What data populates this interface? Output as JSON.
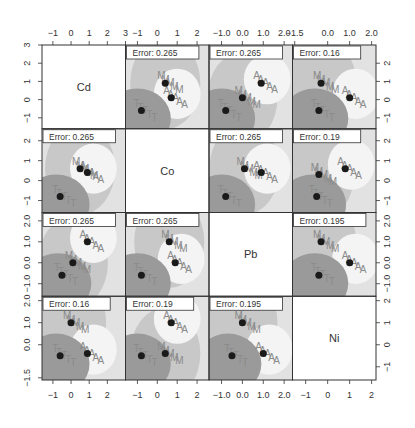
{
  "chart_data": {
    "type": "scatter",
    "subtype": "partition-plot-matrix",
    "variables": [
      "Cd",
      "Co",
      "Pb",
      "Ni"
    ],
    "classes": [
      "A",
      "M",
      "T"
    ],
    "grid": false,
    "legend": null,
    "axes": {
      "Cd": {
        "range": [
          -1.6,
          3.0
        ],
        "ticks": [
          "-1",
          "0",
          "1",
          "2",
          "3"
        ],
        "tick_values": [
          -1,
          0,
          1,
          2,
          3
        ]
      },
      "Co": {
        "range": [
          -1.6,
          2.6
        ],
        "ticks": [
          "-1",
          "0",
          "1",
          "2"
        ],
        "tick_values": [
          -1,
          0,
          1,
          2
        ]
      },
      "Pb": {
        "range": [
          -1.6,
          2.4
        ],
        "ticks": [
          "-1.0",
          "0.0",
          "1.0",
          "2.0"
        ],
        "tick_values": [
          -1,
          0,
          1,
          2
        ]
      },
      "Ni": {
        "range": [
          -1.6,
          2.2
        ],
        "ticks": [
          "-1.5",
          "0.0",
          "1.0",
          "2.0"
        ],
        "tick_values": [
          -1.5,
          0,
          1,
          2
        ]
      }
    },
    "top_axis_labels": [
      [
        "-1",
        "0",
        "1",
        "2",
        "3"
      ],
      [
        "-1",
        "0",
        "1",
        "2"
      ],
      [
        "-1.0",
        "0.0",
        "1.0",
        "2.0"
      ],
      [
        "-1.5",
        "0.0",
        "1.0",
        "2.0"
      ]
    ],
    "bottom_axis_labels": [
      [
        "-1",
        "0",
        "1",
        "2"
      ],
      [
        "-1",
        "0",
        "1",
        "2"
      ],
      [
        "-1.0",
        "0.0",
        "1.0",
        "2.0"
      ],
      [
        "-1",
        "0",
        "1",
        "2"
      ]
    ],
    "left_axis_labels": [
      [
        "-1",
        "0",
        "1",
        "2",
        "3"
      ],
      [
        "-1",
        "0",
        "1",
        "2"
      ],
      [
        "-1.0",
        "0.0",
        "1.0",
        "2.0"
      ],
      [
        "-1.5",
        "0.0",
        "1.0",
        "2.0"
      ]
    ],
    "right_axis_labels": [
      [
        "-1",
        "0",
        "1",
        "2"
      ],
      [
        "-1",
        "0",
        "1",
        "2"
      ],
      [
        "-1.0",
        "0.0",
        "1.0",
        "2.0"
      ],
      [
        "-1",
        "0",
        "1",
        "2"
      ]
    ],
    "panels": [
      {
        "row": 0,
        "col": 1,
        "x": "Co",
        "y": "Cd",
        "error": "Error: 0.265",
        "centroids": [
          [
            -0.8,
            -0.6
          ],
          [
            0.4,
            0.9
          ],
          [
            0.7,
            0.1
          ]
        ]
      },
      {
        "row": 0,
        "col": 2,
        "x": "Pb",
        "y": "Cd",
        "error": "Error: 0.265",
        "centroids": [
          [
            -0.8,
            -0.6
          ],
          [
            0.0,
            0.1
          ],
          [
            0.9,
            0.9
          ]
        ]
      },
      {
        "row": 0,
        "col": 3,
        "x": "Ni",
        "y": "Cd",
        "error": "Error: 0.16",
        "centroids": [
          [
            -0.4,
            -0.6
          ],
          [
            -0.3,
            0.9
          ],
          [
            1.0,
            0.1
          ]
        ]
      },
      {
        "row": 1,
        "col": 0,
        "x": "Cd",
        "y": "Co",
        "error": "Error: 0.265",
        "centroids": [
          [
            -0.6,
            -0.8
          ],
          [
            0.5,
            0.6
          ],
          [
            0.9,
            0.4
          ]
        ]
      },
      {
        "row": 1,
        "col": 2,
        "x": "Pb",
        "y": "Co",
        "error": "Error: 0.265",
        "centroids": [
          [
            -0.8,
            -0.8
          ],
          [
            0.1,
            0.6
          ],
          [
            0.9,
            0.4
          ]
        ]
      },
      {
        "row": 1,
        "col": 3,
        "x": "Ni",
        "y": "Co",
        "error": "Error: 0.19",
        "centroids": [
          [
            -0.5,
            -0.8
          ],
          [
            -0.4,
            0.3
          ],
          [
            0.8,
            0.6
          ]
        ]
      },
      {
        "row": 2,
        "col": 0,
        "x": "Cd",
        "y": "Pb",
        "error": "Error: 0.265",
        "centroids": [
          [
            -0.5,
            -0.6
          ],
          [
            0.1,
            0.0
          ],
          [
            0.9,
            1.0
          ]
        ]
      },
      {
        "row": 2,
        "col": 1,
        "x": "Co",
        "y": "Pb",
        "error": "Error: 0.265",
        "centroids": [
          [
            -0.8,
            -0.6
          ],
          [
            0.6,
            1.0
          ],
          [
            0.9,
            0.0
          ]
        ]
      },
      {
        "row": 2,
        "col": 3,
        "x": "Ni",
        "y": "Pb",
        "error": "Error: 0.195",
        "centroids": [
          [
            -0.4,
            -0.6
          ],
          [
            -0.3,
            1.0
          ],
          [
            1.0,
            0.0
          ]
        ]
      },
      {
        "row": 3,
        "col": 0,
        "x": "Cd",
        "y": "Ni",
        "error": "Error: 0.16",
        "centroids": [
          [
            -0.6,
            -0.5
          ],
          [
            0.0,
            1.0
          ],
          [
            0.9,
            -0.4
          ]
        ]
      },
      {
        "row": 3,
        "col": 1,
        "x": "Co",
        "y": "Ni",
        "error": "Error: 0.19",
        "centroids": [
          [
            -0.8,
            -0.5
          ],
          [
            0.4,
            -0.4
          ],
          [
            0.7,
            1.0
          ]
        ]
      },
      {
        "row": 3,
        "col": 2,
        "x": "Pb",
        "y": "Ni",
        "error": "Error: 0.195",
        "centroids": [
          [
            -0.5,
            -0.5
          ],
          [
            0.0,
            1.0
          ],
          [
            1.0,
            -0.4
          ]
        ]
      }
    ],
    "title": "",
    "xlabel": "",
    "ylabel": ""
  },
  "colors": {
    "region_dark": "#9a9a9a",
    "region_mid": "#c8c8c8",
    "region_light": "#e2e2e2",
    "background": "#ffffff",
    "frame": "#333333",
    "centroid": "#1a1a1a",
    "class_label": "#8a8a8a",
    "axis_text": "#333333"
  }
}
